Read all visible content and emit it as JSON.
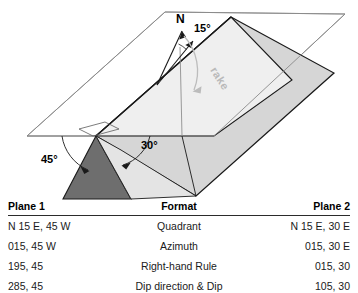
{
  "diagram": {
    "labels": {
      "north": "N",
      "strike_angle": "15°",
      "rake": "rake",
      "dip_plane1": "45°",
      "dip_plane2": "30°"
    },
    "colors": {
      "plane1_fill": "#6e6e6e",
      "plane2_fill": "#d6d6d6",
      "footwall_fill": "#eeeeee",
      "hanging_fill": "#e2e2e2",
      "outline": "#1a1a1a",
      "thin_outline": "#7a7a7a",
      "rake_arc": "#b9b9b9"
    }
  },
  "table": {
    "headers": {
      "plane1": "Plane 1",
      "format": "Format",
      "plane2": "Plane 2"
    },
    "rows": [
      {
        "plane1": "N 15 E, 45 W",
        "format": "Quadrant",
        "plane2": "N 15 E, 30 E"
      },
      {
        "plane1": "015, 45 W",
        "format": "Azimuth",
        "plane2": "015, 30 E"
      },
      {
        "plane1": "195, 45",
        "format": "Right-hand Rule",
        "plane2": "015, 30"
      },
      {
        "plane1": "285, 45",
        "format": "Dip direction & Dip",
        "plane2": "105, 30"
      }
    ]
  }
}
